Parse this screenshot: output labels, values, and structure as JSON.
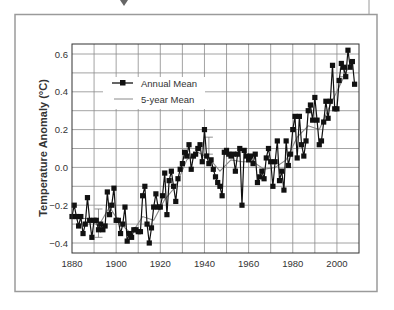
{
  "chart_data": {
    "type": "line",
    "title": "",
    "xlabel": "",
    "ylabel": "Temperature Anomaly (°C)",
    "xlim": [
      1880,
      2010
    ],
    "ylim": [
      -0.45,
      0.65
    ],
    "xticks": [
      1880,
      1900,
      1920,
      1940,
      1960,
      1980,
      2000
    ],
    "yticks": [
      -0.4,
      -0.2,
      0.0,
      0.2,
      0.4,
      0.6
    ],
    "ytick_labels": [
      "−0.4",
      "−0.2",
      "0.0",
      "0.2",
      "0.4",
      "0.6"
    ],
    "grid": true,
    "legend_position": "upper-left",
    "legend": [
      "Annual Mean",
      "5-year Mean"
    ],
    "series": [
      {
        "name": "Annual Mean",
        "marker": "square",
        "x": [
          1880,
          1881,
          1882,
          1883,
          1884,
          1885,
          1886,
          1887,
          1888,
          1889,
          1890,
          1891,
          1892,
          1893,
          1894,
          1895,
          1896,
          1897,
          1898,
          1899,
          1900,
          1901,
          1902,
          1903,
          1904,
          1905,
          1906,
          1907,
          1908,
          1909,
          1910,
          1911,
          1912,
          1913,
          1914,
          1915,
          1916,
          1917,
          1918,
          1919,
          1920,
          1921,
          1922,
          1923,
          1924,
          1925,
          1926,
          1927,
          1928,
          1929,
          1930,
          1931,
          1932,
          1933,
          1934,
          1935,
          1936,
          1937,
          1938,
          1939,
          1940,
          1941,
          1942,
          1943,
          1944,
          1945,
          1946,
          1947,
          1948,
          1949,
          1950,
          1951,
          1952,
          1953,
          1954,
          1955,
          1956,
          1957,
          1958,
          1959,
          1960,
          1961,
          1962,
          1963,
          1964,
          1965,
          1966,
          1967,
          1968,
          1969,
          1970,
          1971,
          1972,
          1973,
          1974,
          1975,
          1976,
          1977,
          1978,
          1979,
          1980,
          1981,
          1982,
          1983,
          1984,
          1985,
          1986,
          1987,
          1988,
          1989,
          1990,
          1991,
          1992,
          1993,
          1994,
          1995,
          1996,
          1997,
          1998,
          1999,
          2000,
          2001,
          2002,
          2003,
          2004,
          2005,
          2006,
          2007,
          2008
        ],
        "values": [
          -0.26,
          -0.2,
          -0.26,
          -0.31,
          -0.26,
          -0.35,
          -0.3,
          -0.16,
          -0.28,
          -0.37,
          -0.28,
          -0.28,
          -0.33,
          -0.3,
          -0.33,
          -0.31,
          -0.13,
          -0.25,
          -0.2,
          -0.11,
          -0.28,
          -0.28,
          -0.35,
          -0.3,
          -0.21,
          -0.39,
          -0.35,
          -0.37,
          -0.33,
          -0.33,
          -0.34,
          -0.34,
          -0.15,
          -0.1,
          -0.3,
          -0.4,
          -0.32,
          -0.21,
          -0.14,
          -0.21,
          -0.21,
          -0.15,
          -0.03,
          -0.25,
          -0.07,
          -0.02,
          -0.1,
          -0.18,
          -0.06,
          -0.01,
          0.02,
          0.08,
          0.06,
          0.12,
          -0.01,
          0.06,
          0.07,
          0.1,
          0.12,
          0.03,
          0.2,
          0.06,
          0.02,
          0.04,
          -0.01,
          -0.05,
          -0.08,
          -0.1,
          -0.15,
          0.08,
          0.09,
          0.07,
          0.06,
          0.07,
          -0.02,
          0.07,
          0.1,
          -0.2,
          0.09,
          0.06,
          0.04,
          0.06,
          0.02,
          0.07,
          -0.08,
          -0.05,
          -0.02,
          -0.06,
          0.05,
          0.1,
          0.03,
          -0.1,
          0.03,
          0.14,
          -0.07,
          -0.02,
          -0.12,
          0.14,
          0.01,
          0.07,
          0.2,
          0.27,
          0.05,
          0.27,
          0.12,
          0.06,
          0.14,
          0.3,
          0.33,
          0.25,
          0.37,
          0.25,
          0.12,
          0.14,
          0.24,
          0.35,
          0.26,
          0.35,
          0.54,
          0.31,
          0.31,
          0.46,
          0.55,
          0.53,
          0.48,
          0.62,
          0.53,
          0.56,
          0.44
        ]
      },
      {
        "name": "5-year Mean",
        "marker": "none",
        "x": [
          1882,
          1887,
          1892,
          1897,
          1902,
          1907,
          1912,
          1917,
          1922,
          1927,
          1932,
          1937,
          1942,
          1947,
          1952,
          1957,
          1962,
          1967,
          1972,
          1977,
          1982,
          1987,
          1992,
          1997,
          2002,
          2006
        ],
        "values": [
          -0.27,
          -0.27,
          -0.31,
          -0.21,
          -0.3,
          -0.35,
          -0.26,
          -0.28,
          -0.17,
          -0.1,
          0.04,
          0.08,
          0.05,
          -0.02,
          0.04,
          0.03,
          0.03,
          -0.01,
          0.0,
          0.04,
          0.16,
          0.22,
          0.2,
          0.33,
          0.45,
          0.55
        ]
      }
    ],
    "error_bars": [
      {
        "x": 1892,
        "center": -0.29,
        "low": -0.37,
        "high": -0.22
      },
      {
        "x": 1942,
        "center": 0.12,
        "low": 0.07,
        "high": 0.16
      },
      {
        "x": 2003,
        "center": 0.5,
        "low": 0.48,
        "high": 0.52
      }
    ]
  },
  "colors": {
    "annual_line": "#111111",
    "five_year_line": "#8a8a8a",
    "grid": "#8c8c8c",
    "frame": "#9a9a9a",
    "text": "#333333"
  }
}
